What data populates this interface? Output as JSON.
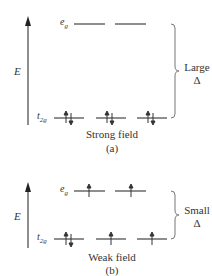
{
  "panels": [
    {
      "id": "a",
      "axis_label": "E",
      "upper_level": {
        "label_base": "e",
        "label_sub": "g",
        "orbitals": 2,
        "electrons": [
          "",
          ""
        ]
      },
      "lower_level": {
        "label_base": "t",
        "label_sub": "2g",
        "orbitals": 3,
        "electrons": [
          "up-down",
          "up-down",
          "up-down"
        ]
      },
      "splitting_label_line1": "Large",
      "splitting_label_line2": "Δ",
      "caption": "Strong field",
      "sub_caption": "(a)"
    },
    {
      "id": "b",
      "axis_label": "E",
      "upper_level": {
        "label_base": "e",
        "label_sub": "g",
        "orbitals": 2,
        "electrons": [
          "up",
          "up"
        ]
      },
      "lower_level": {
        "label_base": "t",
        "label_sub": "2g",
        "orbitals": 3,
        "electrons": [
          "up-down",
          "up",
          "up"
        ]
      },
      "splitting_label_line1": "Small",
      "splitting_label_line2": "Δ",
      "caption": "Weak field",
      "sub_caption": "(b)"
    }
  ],
  "colors": {
    "line": "#444444",
    "text": "#333333",
    "brace": "#777777"
  }
}
